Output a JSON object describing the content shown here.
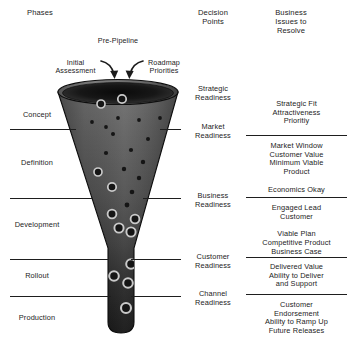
{
  "diagram": {
    "columns": {
      "phases_header": "Phases",
      "decision_header": "Decision\nPoints",
      "issues_header": "Business\nIssues to\nResolve"
    },
    "prepipeline": {
      "label": "Pre-Pipeline",
      "left_annotation": "Initial\nAssessment",
      "right_annotation": "Roadmap\nPriorities"
    },
    "phases": [
      {
        "label": "Concept"
      },
      {
        "label": "Definition"
      },
      {
        "label": "Development"
      },
      {
        "label": "Rollout"
      },
      {
        "label": "Production"
      }
    ],
    "decision_points": [
      {
        "label": "Strategic\nReadiness"
      },
      {
        "label": "Market\nReadiness"
      },
      {
        "label": "Business\nReadiness"
      },
      {
        "label": "Customer\nReadiness"
      },
      {
        "label": "Channel\nReadiness"
      }
    ],
    "business_issues": [
      {
        "label": "Strategic Fit\nAttractiveness\nPrioritiy"
      },
      {
        "label": "Market Window\nCustomer Value\nMinimum Viable\nProduct\n\nEconomics Okay"
      },
      {
        "label": "Engaged Lead\nCustomer\n\nViable Plan\nCompetitive Product\nBusiness Case"
      },
      {
        "label": "Delivered Value\nAbility to Deliver\nand Support"
      },
      {
        "label": "Customer\nEndorsement\nAbility to Ramp Up\nFuture Releases"
      }
    ],
    "colors": {
      "ink": "#1c1c1c",
      "rule": "#1e1e1e",
      "funnel_top": "#6e6e6e",
      "funnel_mid": "#4a4a4a",
      "funnel_bottom": "#141414",
      "funnel_rim": "#121212",
      "funnel_interior": "#101010",
      "dot_fill": "#151515",
      "dot_ring": "#c9c9c9",
      "page_bg": "#ffffff"
    }
  },
  "chart_data": {
    "type": "diagram",
    "shape": "funnel",
    "stage_divider_y": [
      129,
      198,
      259,
      296
    ],
    "particles": [
      {
        "cx": 122,
        "cy": 99,
        "r": 4.2,
        "ring": true
      },
      {
        "cx": 101,
        "cy": 104,
        "r": 4.0,
        "ring": true
      },
      {
        "cx": 118,
        "cy": 118,
        "r": 1.9,
        "ring": false
      },
      {
        "cx": 92,
        "cy": 122,
        "r": 1.9,
        "ring": false
      },
      {
        "cx": 139,
        "cy": 120,
        "r": 1.9,
        "ring": false
      },
      {
        "cx": 160,
        "cy": 118,
        "r": 1.9,
        "ring": false
      },
      {
        "cx": 106,
        "cy": 127,
        "r": 1.9,
        "ring": false
      },
      {
        "cx": 113,
        "cy": 134,
        "r": 2.0,
        "ring": false
      },
      {
        "cx": 148,
        "cy": 139,
        "r": 2.0,
        "ring": false
      },
      {
        "cx": 131,
        "cy": 150,
        "r": 2.1,
        "ring": false
      },
      {
        "cx": 106,
        "cy": 153,
        "r": 2.1,
        "ring": false
      },
      {
        "cx": 143,
        "cy": 162,
        "r": 2.2,
        "ring": false
      },
      {
        "cx": 98,
        "cy": 172,
        "r": 4.0,
        "ring": true
      },
      {
        "cx": 124,
        "cy": 169,
        "r": 2.2,
        "ring": false
      },
      {
        "cx": 139,
        "cy": 178,
        "r": 2.2,
        "ring": false
      },
      {
        "cx": 112,
        "cy": 187,
        "r": 4.2,
        "ring": true
      },
      {
        "cx": 132,
        "cy": 192,
        "r": 2.3,
        "ring": false
      },
      {
        "cx": 127,
        "cy": 205,
        "r": 2.4,
        "ring": false
      },
      {
        "cx": 112,
        "cy": 214,
        "r": 4.4,
        "ring": true
      },
      {
        "cx": 135,
        "cy": 219,
        "r": 4.4,
        "ring": true
      },
      {
        "cx": 119,
        "cy": 228,
        "r": 4.6,
        "ring": true
      },
      {
        "cx": 131,
        "cy": 232,
        "r": 4.6,
        "ring": true
      },
      {
        "cx": 131,
        "cy": 264,
        "r": 4.8,
        "ring": true
      },
      {
        "cx": 114,
        "cy": 276,
        "r": 4.8,
        "ring": true
      },
      {
        "cx": 128,
        "cy": 283,
        "r": 4.8,
        "ring": true
      },
      {
        "cx": 126,
        "cy": 308,
        "r": 5.0,
        "ring": true
      }
    ]
  }
}
